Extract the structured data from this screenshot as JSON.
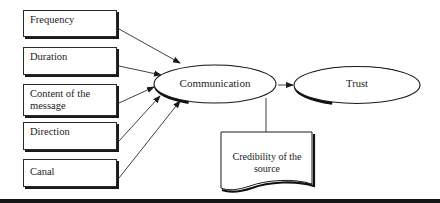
{
  "diagram": {
    "type": "conceptual-model",
    "factors": [
      {
        "id": "frequency",
        "label": "Frequency"
      },
      {
        "id": "duration",
        "label": "Duration"
      },
      {
        "id": "content",
        "label": "Content of the message"
      },
      {
        "id": "direction",
        "label": "Direction"
      },
      {
        "id": "canal",
        "label": "Canal"
      }
    ],
    "nodes": {
      "communication": {
        "label": "Communication",
        "shape": "ellipse"
      },
      "trust": {
        "label": "Trust",
        "shape": "ellipse"
      },
      "credibility": {
        "label": "Credibility of the source",
        "shape": "document"
      }
    },
    "edges": [
      {
        "from": "Frequency",
        "to": "Communication"
      },
      {
        "from": "Duration",
        "to": "Communication"
      },
      {
        "from": "Content of the message",
        "to": "Communication"
      },
      {
        "from": "Direction",
        "to": "Communication"
      },
      {
        "from": "Canal",
        "to": "Communication"
      },
      {
        "from": "Communication",
        "to": "Trust"
      },
      {
        "from": "Credibility of the source",
        "to": "Communication→Trust link",
        "style": "line"
      }
    ],
    "colors": {
      "stroke": "#1a1a1a",
      "background": "#ffffff"
    }
  }
}
